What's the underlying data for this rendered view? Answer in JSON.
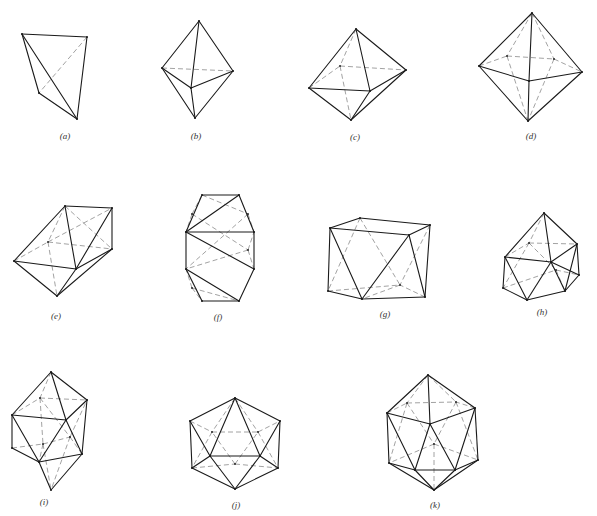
{
  "figure": {
    "width": 597,
    "height": 516,
    "colors": {
      "solid_edge": "#1a1a1a",
      "hidden_edge": "#8a8a8a",
      "background": "#ffffff"
    }
  },
  "polyhedra": [
    {
      "id": "a",
      "caption": "(a)",
      "caption_pos": [
        65,
        137
      ],
      "vertices": [
        [
          22,
          34
        ],
        [
          87,
          37
        ],
        [
          39,
          93
        ],
        [
          77,
          119
        ]
      ],
      "solid": [
        [
          0,
          1
        ],
        [
          0,
          2
        ],
        [
          0,
          3
        ],
        [
          1,
          3
        ],
        [
          2,
          3
        ]
      ],
      "dashed": [
        [
          1,
          2
        ]
      ]
    },
    {
      "id": "b",
      "caption": "(b)",
      "caption_pos": [
        196,
        137
      ],
      "vertices": [
        [
          199,
          21
        ],
        [
          162,
          68
        ],
        [
          233,
          71
        ],
        [
          191,
          88
        ],
        [
          195,
          118
        ]
      ],
      "solid": [
        [
          0,
          1
        ],
        [
          0,
          2
        ],
        [
          0,
          3
        ],
        [
          1,
          3
        ],
        [
          2,
          3
        ],
        [
          1,
          4
        ],
        [
          2,
          4
        ],
        [
          3,
          4
        ]
      ],
      "dashed": [
        [
          1,
          2
        ]
      ]
    },
    {
      "id": "c",
      "caption": "(c)",
      "caption_pos": [
        355,
        138
      ],
      "vertices": [
        [
          356,
          29
        ],
        [
          309,
          88
        ],
        [
          340,
          66
        ],
        [
          406,
          70
        ],
        [
          370,
          91
        ],
        [
          351,
          120
        ]
      ],
      "solid": [
        [
          0,
          1
        ],
        [
          0,
          3
        ],
        [
          0,
          4
        ],
        [
          1,
          4
        ],
        [
          3,
          4
        ],
        [
          1,
          5
        ],
        [
          3,
          5
        ],
        [
          4,
          5
        ]
      ],
      "dashed": [
        [
          0,
          2
        ],
        [
          1,
          2
        ],
        [
          2,
          3
        ],
        [
          2,
          5
        ]
      ]
    },
    {
      "id": "d",
      "caption": "(d)",
      "caption_pos": [
        531,
        137
      ],
      "vertices": [
        [
          532,
          13
        ],
        [
          479,
          66
        ],
        [
          507,
          56
        ],
        [
          554,
          59
        ],
        [
          582,
          72
        ],
        [
          529,
          81
        ],
        [
          528,
          121
        ]
      ],
      "solid": [
        [
          0,
          1
        ],
        [
          0,
          4
        ],
        [
          0,
          5
        ],
        [
          1,
          5
        ],
        [
          4,
          5
        ],
        [
          1,
          6
        ],
        [
          4,
          6
        ],
        [
          5,
          6
        ]
      ],
      "dashed": [
        [
          0,
          2
        ],
        [
          0,
          3
        ],
        [
          1,
          2
        ],
        [
          2,
          3
        ],
        [
          3,
          4
        ],
        [
          2,
          6
        ],
        [
          3,
          6
        ]
      ]
    },
    {
      "id": "e",
      "caption": "(e)",
      "caption_pos": [
        56,
        317
      ],
      "vertices": [
        [
          65,
          206
        ],
        [
          112,
          208
        ],
        [
          14,
          261
        ],
        [
          48,
          242
        ],
        [
          76,
          269
        ],
        [
          112,
          249
        ],
        [
          57,
          296
        ]
      ],
      "solid": [
        [
          0,
          1
        ],
        [
          1,
          5
        ],
        [
          0,
          2
        ],
        [
          0,
          4
        ],
        [
          2,
          4
        ],
        [
          4,
          5
        ],
        [
          2,
          6
        ],
        [
          4,
          6
        ],
        [
          5,
          6
        ],
        [
          1,
          4
        ]
      ],
      "dashed": [
        [
          0,
          3
        ],
        [
          2,
          3
        ],
        [
          3,
          5
        ],
        [
          0,
          5
        ],
        [
          3,
          6
        ],
        [
          3,
          1
        ]
      ]
    },
    {
      "id": "f",
      "caption": "(f)",
      "caption_pos": [
        218,
        318
      ],
      "vertices": [
        [
          202,
          195
        ],
        [
          239,
          195
        ],
        [
          186,
          232
        ],
        [
          254,
          232
        ],
        [
          186,
          269
        ],
        [
          254,
          269
        ],
        [
          202,
          301
        ],
        [
          239,
          301
        ],
        [
          192,
          214
        ],
        [
          248,
          250
        ],
        [
          192,
          288
        ],
        [
          248,
          214
        ]
      ],
      "solid": [
        [
          0,
          1
        ],
        [
          0,
          2
        ],
        [
          1,
          3
        ],
        [
          2,
          4
        ],
        [
          3,
          5
        ],
        [
          4,
          6
        ],
        [
          5,
          7
        ],
        [
          6,
          7
        ],
        [
          2,
          1
        ],
        [
          2,
          5
        ],
        [
          4,
          7
        ],
        [
          2,
          3
        ]
      ],
      "dashed": [
        [
          0,
          11
        ],
        [
          11,
          3
        ],
        [
          8,
          0
        ],
        [
          8,
          2
        ],
        [
          8,
          9
        ],
        [
          9,
          3
        ],
        [
          9,
          4
        ],
        [
          9,
          5
        ],
        [
          10,
          4
        ],
        [
          10,
          6
        ],
        [
          10,
          7
        ],
        [
          11,
          4
        ]
      ]
    },
    {
      "id": "g",
      "caption": "(g)",
      "caption_pos": [
        385,
        315
      ],
      "vertices": [
        [
          330,
          228
        ],
        [
          360,
          218
        ],
        [
          430,
          225
        ],
        [
          409,
          235
        ],
        [
          328,
          291
        ],
        [
          362,
          299
        ],
        [
          425,
          297
        ],
        [
          400,
          285
        ]
      ],
      "solid": [
        [
          0,
          1
        ],
        [
          1,
          2
        ],
        [
          0,
          3
        ],
        [
          2,
          3
        ],
        [
          0,
          4
        ],
        [
          4,
          5
        ],
        [
          5,
          6
        ],
        [
          2,
          6
        ],
        [
          0,
          5
        ],
        [
          3,
          5
        ],
        [
          3,
          6
        ]
      ],
      "dashed": [
        [
          1,
          4
        ],
        [
          1,
          7
        ],
        [
          4,
          7
        ],
        [
          6,
          7
        ],
        [
          2,
          7
        ],
        [
          7,
          5
        ]
      ]
    },
    {
      "id": "h",
      "caption": "(h)",
      "caption_pos": [
        542,
        313
      ],
      "vertices": [
        [
          544,
          213
        ],
        [
          505,
          257
        ],
        [
          529,
          243
        ],
        [
          577,
          244
        ],
        [
          551,
          262
        ],
        [
          579,
          275
        ],
        [
          503,
          288
        ],
        [
          527,
          300
        ],
        [
          565,
          291
        ],
        [
          556,
          270
        ]
      ],
      "solid": [
        [
          0,
          1
        ],
        [
          0,
          3
        ],
        [
          0,
          4
        ],
        [
          1,
          4
        ],
        [
          3,
          4
        ],
        [
          1,
          6
        ],
        [
          6,
          7
        ],
        [
          7,
          8
        ],
        [
          3,
          8
        ],
        [
          1,
          7
        ],
        [
          4,
          7
        ],
        [
          4,
          8
        ],
        [
          4,
          5
        ],
        [
          5,
          8
        ],
        [
          3,
          5
        ]
      ],
      "dashed": [
        [
          0,
          2
        ],
        [
          1,
          2
        ],
        [
          2,
          3
        ],
        [
          2,
          9
        ],
        [
          6,
          9
        ],
        [
          9,
          8
        ],
        [
          2,
          6
        ],
        [
          9,
          5
        ]
      ]
    },
    {
      "id": "i",
      "caption": "(i)",
      "caption_pos": [
        44,
        503
      ],
      "vertices": [
        [
          51,
          372
        ],
        [
          12,
          415
        ],
        [
          40,
          398
        ],
        [
          87,
          400
        ],
        [
          66,
          420
        ],
        [
          12,
          448
        ],
        [
          39,
          462
        ],
        [
          82,
          454
        ],
        [
          51,
          490
        ],
        [
          43,
          444
        ],
        [
          70,
          437
        ]
      ],
      "solid": [
        [
          0,
          1
        ],
        [
          0,
          3
        ],
        [
          0,
          4
        ],
        [
          1,
          4
        ],
        [
          3,
          4
        ],
        [
          1,
          5
        ],
        [
          5,
          6
        ],
        [
          6,
          7
        ],
        [
          3,
          7
        ],
        [
          1,
          6
        ],
        [
          4,
          6
        ],
        [
          4,
          7
        ],
        [
          6,
          8
        ],
        [
          7,
          8
        ]
      ],
      "dashed": [
        [
          0,
          2
        ],
        [
          1,
          2
        ],
        [
          2,
          3
        ],
        [
          2,
          9
        ],
        [
          2,
          10
        ],
        [
          9,
          10
        ],
        [
          5,
          9
        ],
        [
          9,
          8
        ],
        [
          10,
          8
        ],
        [
          10,
          3
        ],
        [
          9,
          6
        ],
        [
          10,
          7
        ]
      ]
    },
    {
      "id": "j",
      "caption": "(j)",
      "caption_pos": [
        236,
        506
      ],
      "vertices": [
        [
          235,
          398
        ],
        [
          190,
          421
        ],
        [
          280,
          421
        ],
        [
          210,
          456
        ],
        [
          260,
          456
        ],
        [
          192,
          468
        ],
        [
          278,
          468
        ],
        [
          235,
          489
        ],
        [
          235,
          464
        ],
        [
          212,
          432
        ],
        [
          258,
          432
        ]
      ],
      "solid": [
        [
          0,
          1
        ],
        [
          0,
          2
        ],
        [
          0,
          3
        ],
        [
          0,
          4
        ],
        [
          1,
          3
        ],
        [
          2,
          4
        ],
        [
          3,
          4
        ],
        [
          1,
          5
        ],
        [
          2,
          6
        ],
        [
          3,
          5
        ],
        [
          4,
          6
        ],
        [
          5,
          7
        ],
        [
          6,
          7
        ],
        [
          3,
          7
        ],
        [
          4,
          7
        ]
      ],
      "dashed": [
        [
          1,
          9
        ],
        [
          9,
          10
        ],
        [
          10,
          2
        ],
        [
          0,
          9
        ],
        [
          0,
          10
        ],
        [
          5,
          8
        ],
        [
          8,
          6
        ],
        [
          8,
          9
        ],
        [
          8,
          10
        ],
        [
          9,
          5
        ],
        [
          10,
          6
        ]
      ]
    },
    {
      "id": "k",
      "caption": "(k)",
      "caption_pos": [
        435,
        506
      ],
      "vertices": [
        [
          428,
          375
        ],
        [
          387,
          413
        ],
        [
          475,
          408
        ],
        [
          430,
          424
        ],
        [
          389,
          463
        ],
        [
          415,
          470
        ],
        [
          455,
          470
        ],
        [
          478,
          460
        ],
        [
          434,
          490
        ],
        [
          407,
          403
        ],
        [
          456,
          402
        ],
        [
          434,
          444
        ]
      ],
      "solid": [
        [
          0,
          1
        ],
        [
          0,
          2
        ],
        [
          0,
          3
        ],
        [
          1,
          3
        ],
        [
          2,
          3
        ],
        [
          1,
          4
        ],
        [
          2,
          7
        ],
        [
          4,
          5
        ],
        [
          5,
          6
        ],
        [
          6,
          7
        ],
        [
          3,
          5
        ],
        [
          3,
          6
        ],
        [
          1,
          5
        ],
        [
          2,
          6
        ],
        [
          4,
          8
        ],
        [
          5,
          8
        ],
        [
          6,
          8
        ],
        [
          7,
          8
        ]
      ],
      "dashed": [
        [
          0,
          9
        ],
        [
          0,
          10
        ],
        [
          9,
          10
        ],
        [
          1,
          9
        ],
        [
          2,
          10
        ],
        [
          9,
          11
        ],
        [
          10,
          11
        ],
        [
          11,
          4
        ],
        [
          11,
          7
        ],
        [
          11,
          8
        ],
        [
          9,
          4
        ],
        [
          10,
          7
        ]
      ]
    }
  ]
}
